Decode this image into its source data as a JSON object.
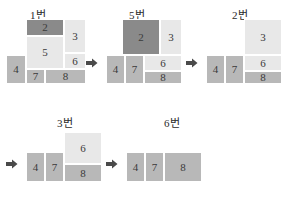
{
  "palette": {
    "dark": "#8a8a8a",
    "mid": "#b8b8b8",
    "light": "#e8e8e8",
    "light2": "#e0e0e0",
    "text": "#3a3a3a",
    "arrow": "#4a4a4a",
    "background": "#ffffff"
  },
  "arrow_icon": "right-arrow-icon",
  "steps": [
    {
      "id": "step-1",
      "caption": "1번",
      "caption_x": 30,
      "caption_y": 6,
      "origin_x": 6,
      "origin_y": 19,
      "arrow": {
        "x": 86,
        "y": 57
      },
      "blocks": [
        {
          "label": "2",
          "x": 20,
          "y": 0,
          "w": 38,
          "h": 17,
          "tone": "dark"
        },
        {
          "label": "3",
          "x": 58,
          "y": 0,
          "w": 22,
          "h": 34,
          "tone": "light"
        },
        {
          "label": "5",
          "x": 20,
          "y": 17,
          "w": 38,
          "h": 33,
          "tone": "light"
        },
        {
          "label": "6",
          "x": 58,
          "y": 34,
          "w": 22,
          "h": 16,
          "tone": "light"
        },
        {
          "label": "4",
          "x": 0,
          "y": 36,
          "w": 20,
          "h": 29,
          "tone": "mid"
        },
        {
          "label": "7",
          "x": 20,
          "y": 50,
          "w": 19,
          "h": 15,
          "tone": "mid"
        },
        {
          "label": "8",
          "x": 39,
          "y": 50,
          "w": 41,
          "h": 15,
          "tone": "mid"
        }
      ]
    },
    {
      "id": "step-5",
      "caption": "5번",
      "caption_x": 129,
      "caption_y": 6,
      "origin_x": 106,
      "origin_y": 19,
      "arrow": {
        "x": 186,
        "y": 57
      },
      "blocks": [
        {
          "label": "2",
          "x": 16,
          "y": 0,
          "w": 38,
          "h": 36,
          "tone": "dark"
        },
        {
          "label": "3",
          "x": 54,
          "y": 0,
          "w": 22,
          "h": 36,
          "tone": "light"
        },
        {
          "label": "6",
          "x": 38,
          "y": 36,
          "w": 38,
          "h": 16,
          "tone": "light"
        },
        {
          "label": "4",
          "x": 0,
          "y": 36,
          "w": 19,
          "h": 29,
          "tone": "mid"
        },
        {
          "label": "7",
          "x": 19,
          "y": 36,
          "w": 19,
          "h": 29,
          "tone": "mid"
        },
        {
          "label": "8",
          "x": 38,
          "y": 52,
          "w": 38,
          "h": 13,
          "tone": "mid"
        }
      ]
    },
    {
      "id": "step-2",
      "caption": "2번",
      "caption_x": 232,
      "caption_y": 6,
      "origin_x": 206,
      "origin_y": 19,
      "arrow": null,
      "blocks": [
        {
          "label": "3",
          "x": 38,
          "y": 0,
          "w": 38,
          "h": 36,
          "tone": "light"
        },
        {
          "label": "6",
          "x": 38,
          "y": 36,
          "w": 38,
          "h": 16,
          "tone": "light"
        },
        {
          "label": "4",
          "x": 0,
          "y": 36,
          "w": 19,
          "h": 29,
          "tone": "mid"
        },
        {
          "label": "7",
          "x": 19,
          "y": 36,
          "w": 19,
          "h": 29,
          "tone": "mid"
        },
        {
          "label": "8",
          "x": 38,
          "y": 52,
          "w": 38,
          "h": 13,
          "tone": "mid"
        }
      ]
    },
    {
      "id": "step-3",
      "caption": "3번",
      "caption_x": 57,
      "caption_y": 114,
      "origin_x": 26,
      "origin_y": 132,
      "arrow": {
        "x": 106,
        "y": 158
      },
      "blocks": [
        {
          "label": "6",
          "x": 38,
          "y": 0,
          "w": 38,
          "h": 32,
          "tone": "light"
        },
        {
          "label": "4",
          "x": 0,
          "y": 20,
          "w": 19,
          "h": 30,
          "tone": "mid"
        },
        {
          "label": "7",
          "x": 19,
          "y": 20,
          "w": 19,
          "h": 30,
          "tone": "mid"
        },
        {
          "label": "8",
          "x": 38,
          "y": 32,
          "w": 38,
          "h": 18,
          "tone": "mid"
        }
      ]
    },
    {
      "id": "step-6",
      "caption": "6번",
      "caption_x": 164,
      "caption_y": 114,
      "origin_x": 126,
      "origin_y": 152,
      "arrow": null,
      "blocks": [
        {
          "label": "4",
          "x": 0,
          "y": 0,
          "w": 19,
          "h": 30,
          "tone": "mid"
        },
        {
          "label": "7",
          "x": 19,
          "y": 0,
          "w": 19,
          "h": 30,
          "tone": "mid"
        },
        {
          "label": "8",
          "x": 38,
          "y": 0,
          "w": 38,
          "h": 30,
          "tone": "mid"
        }
      ]
    }
  ],
  "leading_arrows": [
    {
      "id": "lead-arrow-row2",
      "x": 6,
      "y": 158
    }
  ]
}
